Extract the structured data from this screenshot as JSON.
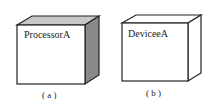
{
  "nodes": [
    {
      "id": "a",
      "label": "ProcessorA",
      "caption": "( a )",
      "shaded_side": true,
      "side_color": "#8a8a8a",
      "top_color": "#c8c8c8"
    },
    {
      "id": "b",
      "label": "DeviceeA",
      "caption": "( b )",
      "shaded_side": false,
      "side_color": "#ffffff",
      "top_color": "#ffffff"
    }
  ]
}
